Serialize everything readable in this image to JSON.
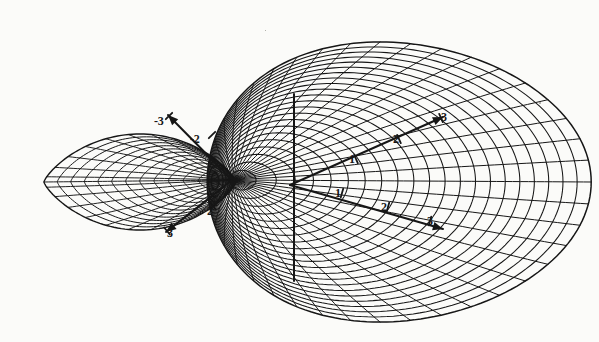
{
  "figure": {
    "title": "",
    "caption": "",
    "background_color": "#fbfbf9",
    "ink_color": "#161616",
    "surface": {
      "type": "wireframe-mesh-surface",
      "lobes": 2,
      "left_lobe": {
        "shape": "lens",
        "mesh_style": "diagonal-crosshatch",
        "u_lines": 13,
        "v_lines": 13
      },
      "right_lobe": {
        "shape": "egg",
        "mesh_style": "diagonal-crosshatch",
        "u_lines": 22,
        "v_lines": 20
      },
      "pinch_point": {
        "x": 232,
        "y": 180
      }
    },
    "axes": [
      {
        "name": "axis-upper-left",
        "direction": "up-left",
        "arrow_tip": {
          "x": 168,
          "y": 115
        },
        "origin": {
          "x": 232,
          "y": 180
        },
        "ticks": [
          {
            "label": "-3",
            "x": 160,
            "y": 122,
            "tick_x": 169,
            "tick_y": 116
          },
          {
            "label": "-2",
            "x": 196,
            "y": 140,
            "tick_x": 212,
            "tick_y": 135
          }
        ]
      },
      {
        "name": "axis-lower-left",
        "direction": "down-left",
        "arrow_tip": {
          "x": 166,
          "y": 232
        },
        "origin": {
          "x": 232,
          "y": 180
        },
        "ticks": [
          {
            "label": "3",
            "x": 173,
            "y": 234,
            "tick_x": 167,
            "tick_y": 231
          },
          {
            "label": "2",
            "x": 213,
            "y": 212,
            "tick_x": 213,
            "tick_y": 206
          }
        ]
      },
      {
        "name": "axis-upper-right",
        "direction": "up-right",
        "arrow_tip": {
          "x": 443,
          "y": 117
        },
        "origin": {
          "x": 290,
          "y": 185
        },
        "ticks": [
          {
            "label": "3",
            "x": 447,
            "y": 118,
            "tick_x": 441,
            "tick_y": 118
          },
          {
            "label": "2",
            "x": 399,
            "y": 140,
            "tick_x": 399,
            "tick_y": 139
          },
          {
            "label": "1",
            "x": 355,
            "y": 160,
            "tick_x": 356,
            "tick_y": 159
          }
        ]
      },
      {
        "name": "axis-lower-right",
        "direction": "down-right",
        "arrow_tip": {
          "x": 443,
          "y": 229
        },
        "origin": {
          "x": 290,
          "y": 185
        },
        "ticks": [
          {
            "label": "3",
            "x": 433,
            "y": 222,
            "tick_x": 430,
            "tick_y": 221
          },
          {
            "label": "2",
            "x": 387,
            "y": 208,
            "tick_x": 388,
            "tick_y": 207
          },
          {
            "label": "1",
            "x": 341,
            "y": 194,
            "tick_x": 342,
            "tick_y": 193
          }
        ]
      },
      {
        "name": "axis-vertical",
        "direction": "vertical",
        "top": {
          "x": 294,
          "y": 94
        },
        "bottom": {
          "x": 294,
          "y": 281
        },
        "ticks": []
      }
    ],
    "artifacts": [
      {
        "name": "scan-speck-right",
        "x": 539,
        "y": 102,
        "size": 2
      },
      {
        "name": "scan-speck-top",
        "x": 265,
        "y": 30,
        "size": 1
      }
    ]
  }
}
